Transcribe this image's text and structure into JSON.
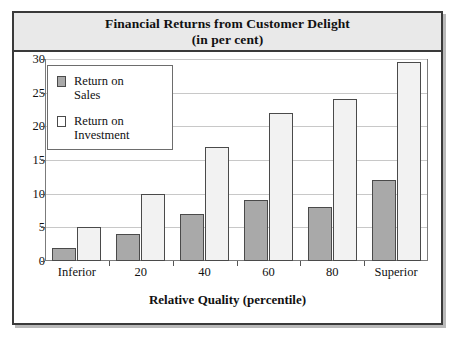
{
  "chart_data": {
    "type": "bar",
    "title": "Financial Returns from Customer Delight",
    "subtitle": "(in per cent)",
    "xlabel": "Relative Quality (percentile)",
    "ylabel": "",
    "categories": [
      "Inferior",
      "20",
      "40",
      "60",
      "80",
      "Superior"
    ],
    "series": [
      {
        "name": "Return on Sales",
        "values": [
          2,
          4,
          7,
          9,
          8,
          12
        ],
        "color": "#a9a9a9"
      },
      {
        "name": "Return on Investment",
        "values": [
          5,
          10,
          17,
          22,
          24,
          29.5
        ],
        "color": "#f2f2f2"
      }
    ],
    "ylim": [
      0,
      30
    ],
    "yticks": [
      0,
      5,
      10,
      15,
      20,
      25,
      30
    ],
    "ytick_labels": [
      "0",
      "5",
      "10",
      "15",
      "20",
      "25",
      "30"
    ],
    "grid": true,
    "legend_position": "top-left"
  },
  "legend": {
    "entries": [
      {
        "label_line1": "Return on",
        "label_line2": "Sales"
      },
      {
        "label_line1": "Return on",
        "label_line2": "Investment"
      }
    ]
  }
}
